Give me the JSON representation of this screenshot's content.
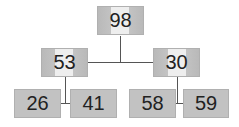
{
  "diagram": {
    "type": "binary-tree",
    "root": {
      "value": "98",
      "left": {
        "value": "53",
        "left": {
          "value": "26"
        },
        "right": {
          "value": "41"
        }
      },
      "right": {
        "value": "30",
        "left": {
          "value": "58"
        },
        "right": {
          "value": "59"
        }
      }
    },
    "colors": {
      "node_fill": "#c0c0c0",
      "node_highlight": "#eeeeee",
      "edge": "#555555",
      "text": "#222222"
    }
  }
}
